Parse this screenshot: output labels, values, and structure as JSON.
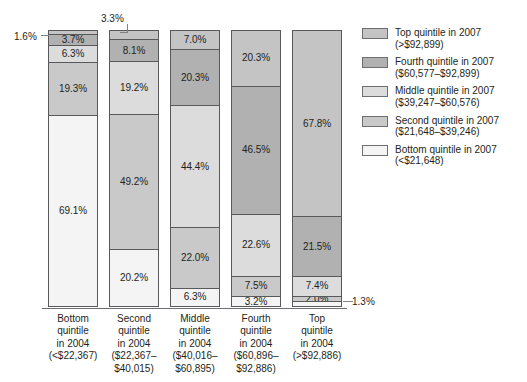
{
  "chart_data": {
    "type": "bar",
    "subtype": "stacked-100-percent",
    "title": "",
    "xlabel": "",
    "ylabel": "",
    "ylim": [
      0,
      100
    ],
    "grid": false,
    "legend_position": "right",
    "categories": [
      "Bottom quintile in 2004 (<$22,367)",
      "Second quintile in 2004 ($22,367–$40,015)",
      "Middle quintile in 2004 ($40,016–$60,895)",
      "Fourth quintile in 2004 ($60,896–$92,886)",
      "Top quintile in 2004 (>$92,886)"
    ],
    "series": [
      {
        "name": "Top quintile in 2007 (>$92,899)",
        "values": [
          1.6,
          3.3,
          7.0,
          20.3,
          67.8
        ]
      },
      {
        "name": "Fourth quintile in 2007 ($60,577–$92,899)",
        "values": [
          3.7,
          8.1,
          20.3,
          46.5,
          21.5
        ]
      },
      {
        "name": "Middle quintile in 2007 ($39,247–$60,576)",
        "values": [
          6.3,
          19.2,
          44.4,
          22.6,
          7.4
        ]
      },
      {
        "name": "Second quintile in 2007 ($21,648–$39,246)",
        "values": [
          19.3,
          49.2,
          22.0,
          7.5,
          2.0
        ]
      },
      {
        "name": "Bottom quintile in 2007 (<$21,648)",
        "values": [
          69.1,
          20.2,
          6.3,
          3.2,
          1.3
        ]
      }
    ]
  },
  "bars": [
    {
      "category_lines": [
        "Bottom",
        "quintile",
        "in 2004",
        "(<$22,367)"
      ],
      "segments": [
        {
          "key": "top",
          "label": "1.6%",
          "pct": 1.6,
          "inline": false
        },
        {
          "key": "fourth",
          "label": "3.7%",
          "pct": 3.7,
          "inline": true
        },
        {
          "key": "middle",
          "label": "6.3%",
          "pct": 6.3,
          "inline": true
        },
        {
          "key": "second",
          "label": "19.3%",
          "pct": 19.3,
          "inline": true
        },
        {
          "key": "bottom",
          "label": "69.1%",
          "pct": 69.1,
          "inline": true
        }
      ]
    },
    {
      "category_lines": [
        "Second",
        "quintile",
        "in 2004",
        "($22,367–",
        "$40,015)"
      ],
      "segments": [
        {
          "key": "top",
          "label": "3.3%",
          "pct": 3.3,
          "inline": false
        },
        {
          "key": "fourth",
          "label": "8.1%",
          "pct": 8.1,
          "inline": true
        },
        {
          "key": "middle",
          "label": "19.2%",
          "pct": 19.2,
          "inline": true
        },
        {
          "key": "second",
          "label": "49.2%",
          "pct": 49.2,
          "inline": true
        },
        {
          "key": "bottom",
          "label": "20.2%",
          "pct": 20.2,
          "inline": true
        }
      ]
    },
    {
      "category_lines": [
        "Middle",
        "quintile",
        "in 2004",
        "($40,016–",
        "$60,895)"
      ],
      "segments": [
        {
          "key": "top",
          "label": "7.0%",
          "pct": 7.0,
          "inline": true
        },
        {
          "key": "fourth",
          "label": "20.3%",
          "pct": 20.3,
          "inline": true
        },
        {
          "key": "middle",
          "label": "44.4%",
          "pct": 44.4,
          "inline": true
        },
        {
          "key": "second",
          "label": "22.0%",
          "pct": 22.0,
          "inline": true
        },
        {
          "key": "bottom",
          "label": "6.3%",
          "pct": 6.3,
          "inline": true
        }
      ]
    },
    {
      "category_lines": [
        "Fourth",
        "quintile",
        "in 2004",
        "($60,896–",
        "$92,886)"
      ],
      "segments": [
        {
          "key": "top",
          "label": "20.3%",
          "pct": 20.3,
          "inline": true
        },
        {
          "key": "fourth",
          "label": "46.5%",
          "pct": 46.5,
          "inline": true
        },
        {
          "key": "middle",
          "label": "22.6%",
          "pct": 22.6,
          "inline": true
        },
        {
          "key": "second",
          "label": "7.5%",
          "pct": 7.5,
          "inline": true
        },
        {
          "key": "bottom",
          "label": "3.2%",
          "pct": 3.2,
          "inline": true
        }
      ]
    },
    {
      "category_lines": [
        "Top",
        "quintile",
        "in 2004",
        "(>$92,886)"
      ],
      "segments": [
        {
          "key": "top",
          "label": "67.8%",
          "pct": 67.8,
          "inline": true
        },
        {
          "key": "fourth",
          "label": "21.5%",
          "pct": 21.5,
          "inline": true
        },
        {
          "key": "middle",
          "label": "7.4%",
          "pct": 7.4,
          "inline": true
        },
        {
          "key": "second",
          "label": "2.0%",
          "pct": 2.0,
          "inline": true
        },
        {
          "key": "bottom",
          "label": "1.3%",
          "pct": 1.3,
          "inline": false
        }
      ]
    }
  ],
  "callouts": [
    {
      "name": "callout-bar1-top",
      "label": "1.6%"
    },
    {
      "name": "callout-bar2-top",
      "label": "3.3%"
    },
    {
      "name": "callout-bar5-bottom",
      "label": "1.3%"
    }
  ],
  "legend": {
    "items": [
      {
        "key": "top",
        "color": "#c4c4c4",
        "line1": "Top quintile in 2007",
        "line2": "(>$92,899)"
      },
      {
        "key": "fourth",
        "color": "#b1b1b1",
        "line1": "Fourth quintile in 2007",
        "line2": "($60,577–$92,899)"
      },
      {
        "key": "middle",
        "color": "#dcdcdc",
        "line1": "Middle quintile in 2007",
        "line2": "($39,247–$60,576)"
      },
      {
        "key": "second",
        "color": "#c9c9c9",
        "line1": "Second quintile in 2007",
        "line2": "($21,648–$39,246)"
      },
      {
        "key": "bottom",
        "color": "#f4f4f4",
        "line1": "Bottom quintile in 2007",
        "line2": "(<$21,648)"
      }
    ]
  }
}
